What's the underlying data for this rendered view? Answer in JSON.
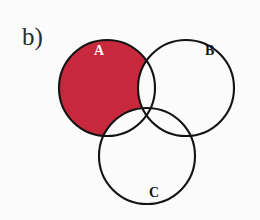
{
  "figure": {
    "panel_label": "b)",
    "caption_type": "venn-diagram",
    "background_color": "#fdfdfd",
    "stroke_color": "#141414",
    "highlight_color": "#c9293d",
    "highlight_description": "A only (A minus B minus C)"
  },
  "sets": [
    {
      "id": "A",
      "label": "A",
      "label_color": "#ffffff",
      "filled": true,
      "fill_color": "#c9293d",
      "cx": 107,
      "cy": 88,
      "r": 48,
      "label_x": 94,
      "label_y": 44
    },
    {
      "id": "B",
      "label": "B",
      "label_color": "#121212",
      "filled": false,
      "fill_color": "none",
      "cx": 186,
      "cy": 88,
      "r": 48,
      "label_x": 205,
      "label_y": 44
    },
    {
      "id": "C",
      "label": "C",
      "label_color": "#121212",
      "filled": false,
      "fill_color": "none",
      "cx": 147,
      "cy": 156,
      "r": 48,
      "label_x": 149,
      "label_y": 186
    }
  ],
  "panel_label_position": {
    "x": 22,
    "y": 24
  },
  "geometry": {
    "stroke_width": 2.1,
    "canvas_width": 260,
    "canvas_height": 220
  }
}
